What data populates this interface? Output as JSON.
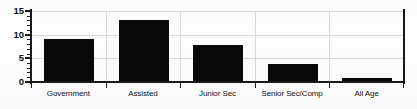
{
  "chart_data": {
    "type": "bar",
    "title": "",
    "subtitle": "",
    "xlabel": "",
    "ylabel": "",
    "categories": [
      "Government",
      "Assisted",
      "Junior Sec",
      "Senior Sec/Comp",
      "All Age"
    ],
    "values": [
      9,
      13,
      7.8,
      3.8,
      0.9
    ],
    "ylim": [
      0,
      15
    ],
    "y_ticks": [
      0,
      5,
      10,
      15
    ],
    "y_tick_labels": [
      "0",
      "5",
      "10",
      "15"
    ],
    "y_minor_tick_step": 1,
    "grid": true,
    "grid_axis": "both",
    "legend": false,
    "legend_position": "none",
    "bar_color": "#080808",
    "background_color": "#fdfdfd",
    "axis_color": "#1a1a1a",
    "gridline_color": "#d8d8d8"
  }
}
